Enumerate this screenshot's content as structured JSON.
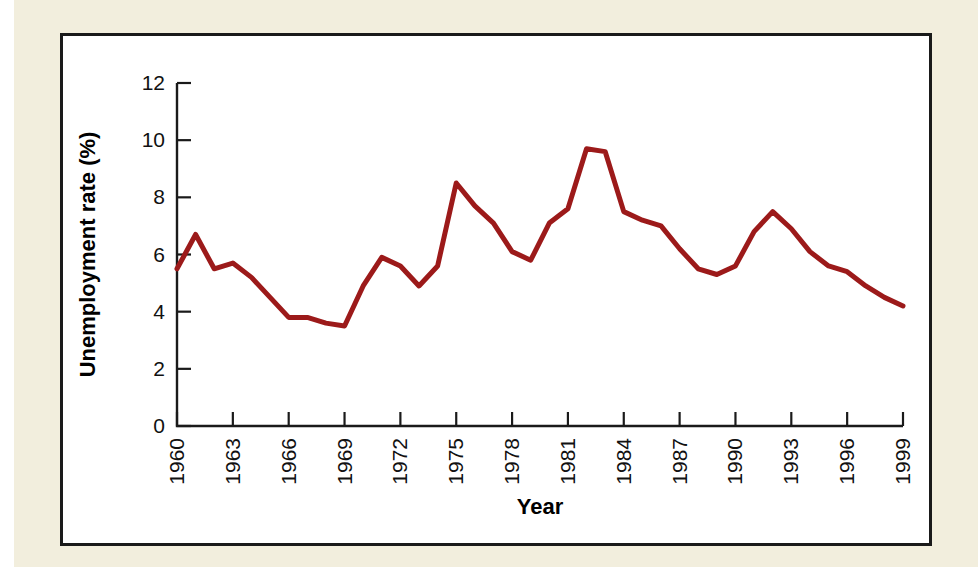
{
  "figure": {
    "background_color": "#f2eedd",
    "plate_color": "#ffffff",
    "frame_color": "#1a1a1a"
  },
  "chart_data": {
    "type": "line",
    "title": "",
    "subtitle": "",
    "xlabel": "Year",
    "ylabel": "Unemployment rate (%)",
    "xlim": [
      1960,
      1999
    ],
    "ylim": [
      0,
      12
    ],
    "grid": false,
    "legend": "none",
    "line_color": "#9c1a1a",
    "line_width": 5,
    "y_ticks": [
      0,
      2,
      4,
      6,
      8,
      10,
      12
    ],
    "y_tick_labels": [
      "0",
      "2",
      "4",
      "6",
      "8",
      "10",
      "12"
    ],
    "x_ticks": [
      1960,
      1963,
      1966,
      1969,
      1972,
      1975,
      1978,
      1981,
      1984,
      1987,
      1990,
      1993,
      1996,
      1999
    ],
    "x_tick_labels": [
      "1960",
      "1963",
      "1966",
      "1969",
      "1972",
      "1975",
      "1978",
      "1981",
      "1984",
      "1987",
      "1990",
      "1993",
      "1996",
      "1999"
    ],
    "x_tick_rotation": 90,
    "x": [
      1960,
      1961,
      1962,
      1963,
      1964,
      1965,
      1966,
      1967,
      1968,
      1969,
      1970,
      1971,
      1972,
      1973,
      1974,
      1975,
      1976,
      1977,
      1978,
      1979,
      1980,
      1981,
      1982,
      1983,
      1984,
      1985,
      1986,
      1987,
      1988,
      1989,
      1990,
      1991,
      1992,
      1993,
      1994,
      1995,
      1996,
      1997,
      1998,
      1999
    ],
    "values": [
      5.5,
      6.7,
      5.5,
      5.7,
      5.2,
      4.5,
      3.8,
      3.8,
      3.6,
      3.5,
      4.9,
      5.9,
      5.6,
      4.9,
      5.6,
      8.5,
      7.7,
      7.1,
      6.1,
      5.8,
      7.1,
      7.6,
      9.7,
      9.6,
      7.5,
      7.2,
      7.0,
      6.2,
      5.5,
      5.3,
      5.6,
      6.8,
      7.5,
      6.9,
      6.1,
      5.6,
      5.4,
      4.9,
      4.5,
      4.2
    ]
  }
}
